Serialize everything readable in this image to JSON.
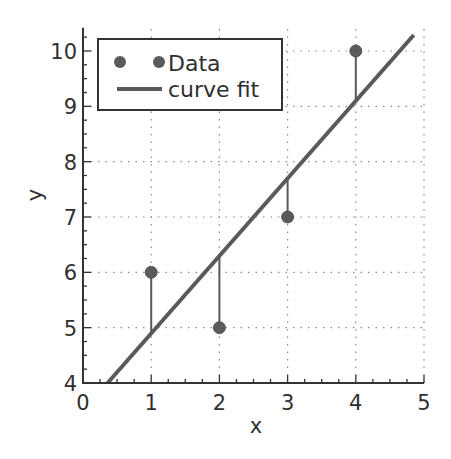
{
  "chart_data": {
    "type": "scatter",
    "title": "",
    "xlabel": "x",
    "ylabel": "y",
    "xlim": [
      0,
      5
    ],
    "ylim": [
      4,
      10.4
    ],
    "xticks": [
      0,
      1,
      2,
      3,
      4,
      5
    ],
    "yticks": [
      4,
      5,
      6,
      7,
      8,
      9,
      10
    ],
    "grid": true,
    "legend_position": "upper left",
    "series": [
      {
        "name": "Data",
        "kind": "scatter",
        "x": [
          1,
          2,
          3,
          4
        ],
        "y": [
          6,
          5,
          7,
          10
        ],
        "color": "#555555"
      },
      {
        "name": "curve fit",
        "kind": "line",
        "slope": 1.4,
        "intercept": 3.5,
        "x": [
          0.36,
          4.85
        ],
        "y": [
          4.0,
          10.29
        ],
        "color": "#555555"
      }
    ],
    "residual_lines": true
  },
  "legend": {
    "items": [
      {
        "label": "Data"
      },
      {
        "label": "curve fit"
      }
    ]
  },
  "colors": {
    "marker": "#5a5a5a",
    "line": "#5a5a5a",
    "axis": "#333333",
    "grid": "#8a8a8a"
  }
}
